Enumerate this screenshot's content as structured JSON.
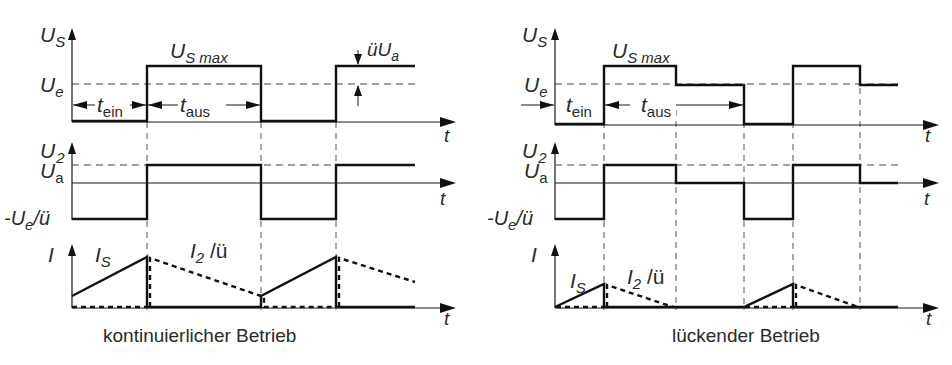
{
  "diagram": {
    "type": "timing-diagram",
    "colors": {
      "line": "#111111",
      "text": "#2a2a2a",
      "background": "#ffffff"
    }
  },
  "panels": [
    {
      "id": "continuous",
      "caption": "kontinuierlicher Betrieb",
      "us_plot": {
        "y_label_main": "U",
        "y_label_sub": "S",
        "ue_label_main": "U",
        "ue_label_sub": "e",
        "usmax_main": "U",
        "usmax_sub": "S max",
        "tein_main": "t",
        "tein_sub": "ein",
        "taus_main": "t",
        "taus_sub": "aus",
        "uua_main": "üU",
        "uua_sub": "a",
        "x_label": "t"
      },
      "u2_plot": {
        "y_label_main": "U",
        "y_label_sub": "2",
        "ua_label_main": "U",
        "ua_label_sub": "a",
        "neg_label_pre": "-U",
        "neg_label_sub": "e",
        "neg_label_post": "/ü",
        "x_label": "t"
      },
      "i_plot": {
        "y_label": "I",
        "is_main": "I",
        "is_sub": "S",
        "i2_main": "I",
        "i2_sub": "2",
        "i2_post": " /ü",
        "x_label": "t"
      }
    },
    {
      "id": "discontinuous",
      "caption": "lückender Betrieb",
      "us_plot": {
        "y_label_main": "U",
        "y_label_sub": "S",
        "ue_label_main": "U",
        "ue_label_sub": "e",
        "usmax_main": "U",
        "usmax_sub": "S max",
        "tein_main": "t",
        "tein_sub": "ein",
        "taus_main": "t",
        "taus_sub": "aus",
        "x_label": "t"
      },
      "u2_plot": {
        "y_label_main": "U",
        "y_label_sub": "2",
        "ua_label_main": "U",
        "ua_label_sub": "a",
        "neg_label_pre": "-U",
        "neg_label_sub": "e",
        "neg_label_post": "/ü",
        "x_label": "t"
      },
      "i_plot": {
        "y_label": "I",
        "is_main": "I",
        "is_sub": "S",
        "i2_main": "I",
        "i2_sub": "2",
        "i2_post": " /ü",
        "x_label": "t"
      }
    }
  ]
}
